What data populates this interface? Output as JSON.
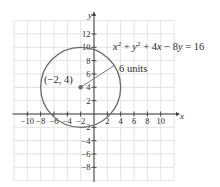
{
  "chart_data": {
    "type": "line",
    "title": "",
    "xlabel": "x",
    "ylabel": "y",
    "xlim": [
      -12,
      12
    ],
    "ylim": [
      -10,
      14
    ],
    "grid": true,
    "x_ticks": [
      -10,
      -8,
      -6,
      -4,
      -2,
      2,
      4,
      6,
      8,
      10
    ],
    "x_tick_labels": [
      "−10",
      "−8",
      "−6",
      "−4",
      "−2",
      "2",
      "4",
      "6",
      "8",
      "10"
    ],
    "y_ticks": [
      12,
      10,
      8,
      6,
      4,
      2,
      -2,
      -4,
      -6,
      -8
    ],
    "y_tick_labels": [
      "12",
      "10",
      "8",
      "6",
      "4",
      "2",
      "−2",
      "−4",
      "−6",
      "−8"
    ],
    "series": [
      {
        "name": "circle",
        "kind": "circle",
        "equation": "x² + y² + 4x − 8y = 16",
        "center": [
          -2,
          4
        ],
        "radius": 6,
        "color": "#6b6b6b"
      }
    ],
    "annotations": [
      {
        "text": "(−2, 4)",
        "x": -2,
        "y": 4,
        "type": "point-label"
      },
      {
        "text": "6 units",
        "type": "radius-label"
      },
      {
        "text": "x² + y² + 4x − 8y = 16",
        "type": "equation-label"
      }
    ]
  },
  "labels": {
    "equation": "x² + y² + 4x − 8y = 16",
    "center_point": "(−2, 4)",
    "radius": "6 units",
    "x_axis": "x",
    "y_axis": "y"
  },
  "colors": {
    "grid": "#dcdcdc",
    "axis": "#3a3a3a",
    "circle": "#6b6b6b",
    "point": "#6b6b6b",
    "text": "#2b2b2b"
  }
}
